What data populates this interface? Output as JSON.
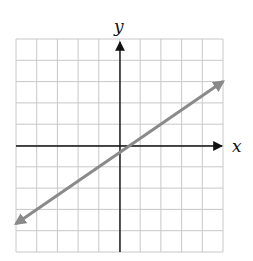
{
  "chart_data": {
    "type": "line",
    "title": "",
    "xlabel": "x",
    "ylabel": "y",
    "xlim": [
      -5,
      5
    ],
    "ylim": [
      -5,
      5
    ],
    "grid": true,
    "grid_step": 1,
    "tick_labels_shown": false,
    "series": [
      {
        "name": "line",
        "equation": "y = (2/3)x - 1/3",
        "x": [
          -5,
          0.5,
          5
        ],
        "y": [
          -3.67,
          0,
          3
        ],
        "color": "#8a8a8a",
        "arrows_both_ends": true
      }
    ]
  },
  "labels": {
    "x_axis": "x",
    "y_axis": "y"
  },
  "colors": {
    "grid": "#c8c8c8",
    "axes": "#111111",
    "line": "#8a8a8a"
  }
}
